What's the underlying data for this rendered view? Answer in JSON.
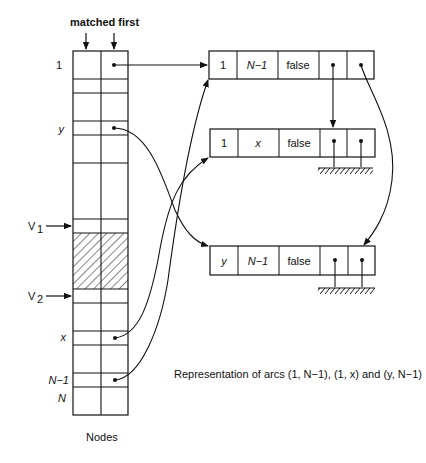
{
  "header": {
    "label": "matched first"
  },
  "nodes_table": {
    "caption": "Nodes",
    "row_labels": {
      "one": "1",
      "y": "y",
      "v1": "V",
      "v1_sub": "1",
      "v2": "V",
      "v2_sub": "2",
      "x": "x",
      "n_minus_1": "N−1",
      "n": "N"
    }
  },
  "records": [
    {
      "id": "arc-1-N-1",
      "fields": [
        "1",
        "N−1",
        "false"
      ],
      "italic": [
        false,
        true,
        false
      ]
    },
    {
      "id": "arc-1-x",
      "fields": [
        "1",
        "x",
        "false"
      ],
      "italic": [
        false,
        true,
        false
      ]
    },
    {
      "id": "arc-y-N-1",
      "fields": [
        "y",
        "N−1",
        "false"
      ],
      "italic": [
        true,
        true,
        false
      ]
    }
  ],
  "caption": "Representation of arcs (1, N−1), (1, x) and (y, N−1)",
  "colors": {
    "line": "#111111",
    "background": "#ffffff"
  }
}
